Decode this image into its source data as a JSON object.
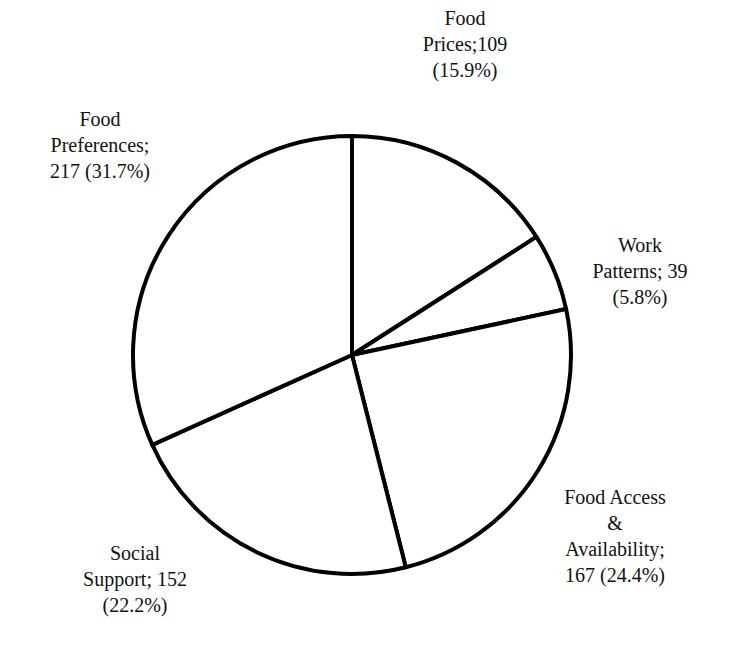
{
  "chart_data": {
    "type": "pie",
    "title": "",
    "start_angle_deg": 90,
    "direction": "clockwise",
    "categories": [
      "Food Prices",
      "Work Patterns",
      "Food Access & Availability",
      "Social Support",
      "Food Preferences"
    ],
    "values": [
      109,
      39,
      167,
      152,
      217
    ],
    "percentages": [
      15.9,
      5.8,
      24.4,
      22.2,
      31.7
    ],
    "fill_color": "#ffffff",
    "stroke_color": "#000000",
    "legend": "none (data labels outside slices)"
  },
  "labels": {
    "food_prices": {
      "line1": "Food",
      "line2": "Prices;109",
      "line3": "(15.9%)"
    },
    "work_patterns": {
      "line1": "Work",
      "line2": "Patterns; 39",
      "line3": "(5.8%)"
    },
    "food_access": {
      "line1": "Food Access",
      "line2": "&",
      "line3": "Availability;",
      "line4": "167 (24.4%)"
    },
    "social_support": {
      "line1": "Social",
      "line2": "Support; 152",
      "line3": "(22.2%)"
    },
    "food_preferences": {
      "line1": "Food",
      "line2": "Preferences;",
      "line3": "217 (31.7%)"
    }
  }
}
